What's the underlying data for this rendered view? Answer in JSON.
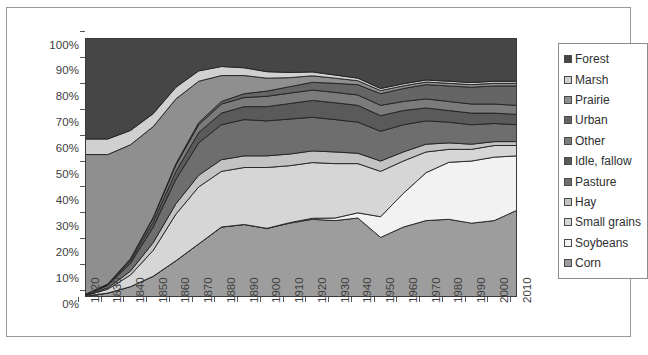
{
  "chart_data": {
    "type": "area",
    "title": "",
    "xlabel": "",
    "ylabel": "",
    "stacked": true,
    "normalized": true,
    "grid": false,
    "legend_position": "right",
    "xlim": [
      1820,
      2010
    ],
    "ylim": [
      0,
      100
    ],
    "x": [
      1820,
      1830,
      1840,
      1850,
      1860,
      1870,
      1880,
      1890,
      1900,
      1910,
      1920,
      1930,
      1940,
      1950,
      1960,
      1970,
      1980,
      1990,
      2000,
      2010
    ],
    "y_tick_labels": [
      "0%",
      "10%",
      "20%",
      "30%",
      "40%",
      "50%",
      "60%",
      "70%",
      "80%",
      "90%",
      "100%"
    ],
    "y_ticks": [
      0,
      10,
      20,
      30,
      40,
      50,
      60,
      70,
      80,
      90,
      100
    ],
    "x_tick_labels": [
      "1820",
      "1830",
      "1840",
      "1850",
      "1860",
      "1870",
      "1880",
      "1890",
      "1900",
      "1910",
      "1920",
      "1930",
      "1940",
      "1950",
      "1960",
      "1970",
      "1980",
      "1990",
      "2000",
      "2010"
    ],
    "series": [
      {
        "name": "Corn",
        "color": "#9d9d9d",
        "values": [
          0.3,
          1.5,
          4.0,
          8.0,
          14.0,
          20.5,
          27.0,
          28.0,
          26.5,
          28.5,
          30.0,
          29.5,
          30.5,
          23.0,
          27.0,
          29.5,
          30.0,
          28.5,
          29.5,
          33.5
        ]
      },
      {
        "name": "Soybeans",
        "color": "#f2f2f2",
        "values": [
          0.0,
          0.0,
          0.0,
          0.0,
          0.0,
          0.0,
          0.0,
          0.0,
          0.0,
          0.2,
          0.4,
          1.0,
          2.0,
          8.0,
          13.0,
          18.5,
          22.0,
          24.0,
          24.5,
          21.0
        ]
      },
      {
        "name": "Small grains",
        "color": "#d6d6d6",
        "values": [
          0.2,
          1.5,
          4.5,
          10.0,
          18.0,
          22.0,
          21.5,
          22.0,
          23.5,
          22.0,
          21.5,
          21.0,
          19.0,
          17.5,
          12.5,
          8.0,
          5.0,
          4.5,
          4.5,
          4.0
        ]
      },
      {
        "name": "Hay",
        "color": "#c3c3c3",
        "values": [
          0.1,
          0.5,
          1.5,
          3.0,
          4.0,
          4.5,
          4.5,
          4.5,
          4.5,
          4.5,
          4.5,
          4.5,
          4.0,
          4.0,
          3.5,
          3.0,
          2.5,
          2.0,
          1.5,
          1.5
        ]
      },
      {
        "name": "Pasture",
        "color": "#6e6e6e",
        "values": [
          0.2,
          1.0,
          3.0,
          6.0,
          9.5,
          12.5,
          13.5,
          14.0,
          13.5,
          13.5,
          13.0,
          12.5,
          12.0,
          11.5,
          10.5,
          9.0,
          8.0,
          7.5,
          7.0,
          6.5
        ]
      },
      {
        "name": "Idle, fallow",
        "color": "#5a5a5a",
        "values": [
          0.1,
          0.3,
          1.0,
          2.0,
          3.0,
          4.0,
          4.5,
          5.0,
          5.5,
          6.0,
          6.5,
          6.5,
          6.5,
          6.0,
          5.5,
          5.0,
          4.5,
          4.5,
          4.0,
          4.0
        ]
      },
      {
        "name": "Other",
        "color": "#7b7b7b",
        "values": [
          0.1,
          0.2,
          0.7,
          1.5,
          2.5,
          3.0,
          3.5,
          3.5,
          4.0,
          4.0,
          4.0,
          4.0,
          4.0,
          4.0,
          3.5,
          3.5,
          3.5,
          3.5,
          3.5,
          3.5
        ]
      },
      {
        "name": "Urban",
        "color": "#656565",
        "values": [
          0.0,
          0.0,
          0.1,
          0.3,
          0.5,
          0.8,
          1.0,
          1.5,
          2.0,
          2.5,
          3.0,
          3.5,
          4.0,
          4.5,
          5.0,
          5.5,
          6.0,
          6.5,
          7.0,
          7.5
        ]
      },
      {
        "name": "Prairie",
        "color": "#8f8f8f",
        "values": [
          54.0,
          50.0,
          44.0,
          35.0,
          25.0,
          16.0,
          10.0,
          7.0,
          5.0,
          3.5,
          2.5,
          2.0,
          1.5,
          1.2,
          1.0,
          1.0,
          1.0,
          1.0,
          1.0,
          1.0
        ]
      },
      {
        "name": "Marsh",
        "color": "#d0d0d0",
        "values": [
          6.0,
          6.0,
          5.5,
          5.0,
          4.5,
          4.0,
          3.5,
          3.0,
          2.5,
          2.0,
          1.5,
          1.2,
          1.0,
          0.8,
          0.8,
          0.8,
          0.8,
          0.8,
          0.8,
          0.8
        ]
      },
      {
        "name": "Forest",
        "color": "#464646",
        "values": [
          39.0,
          39.0,
          35.7,
          29.2,
          19.0,
          12.7,
          11.0,
          11.5,
          13.0,
          13.3,
          13.1,
          14.3,
          15.5,
          19.5,
          17.7,
          16.2,
          16.7,
          17.2,
          16.7,
          16.7
        ]
      }
    ]
  },
  "legend": {
    "items": [
      {
        "label": "Forest",
        "color": "#464646"
      },
      {
        "label": "Marsh",
        "color": "#d0d0d0"
      },
      {
        "label": "Prairie",
        "color": "#8f8f8f"
      },
      {
        "label": "Urban",
        "color": "#656565"
      },
      {
        "label": "Other",
        "color": "#7b7b7b"
      },
      {
        "label": "Idle, fallow",
        "color": "#5a5a5a"
      },
      {
        "label": "Pasture",
        "color": "#6e6e6e"
      },
      {
        "label": "Hay",
        "color": "#c3c3c3"
      },
      {
        "label": "Small grains",
        "color": "#d6d6d6"
      },
      {
        "label": "Soybeans",
        "color": "#f2f2f2"
      },
      {
        "label": "Corn",
        "color": "#9d9d9d"
      }
    ]
  },
  "caption": {
    "text": ""
  }
}
